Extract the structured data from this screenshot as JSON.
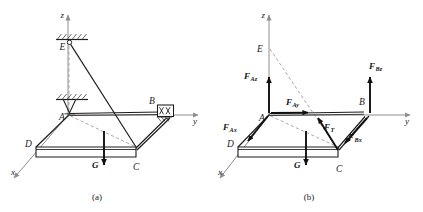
{
  "figure": {
    "panels": [
      {
        "id": "a",
        "caption": "(a)",
        "axes": [
          {
            "name": "z",
            "label": "z"
          },
          {
            "name": "y",
            "label": "y"
          },
          {
            "name": "x",
            "label": "x"
          }
        ],
        "points": [
          {
            "name": "E",
            "label": "E"
          },
          {
            "name": "A",
            "label": "A"
          },
          {
            "name": "B",
            "label": "B"
          },
          {
            "name": "C",
            "label": "C"
          },
          {
            "name": "D",
            "label": "D"
          }
        ],
        "forces": [
          {
            "name": "weight",
            "label": "G",
            "sub": "",
            "direction": "down"
          }
        ],
        "supports": [
          {
            "name": "ceiling-anchor-E",
            "type": "hatched-fixed-surface"
          },
          {
            "name": "pin-support-A",
            "type": "ball-and-socket-hatched"
          },
          {
            "name": "bearing-support-B",
            "type": "roller-box-crossed"
          }
        ]
      },
      {
        "id": "b",
        "caption": "(b)",
        "axes": [
          {
            "name": "z",
            "label": "z"
          },
          {
            "name": "y",
            "label": "y"
          },
          {
            "name": "x",
            "label": "x"
          }
        ],
        "points": [
          {
            "name": "E",
            "label": "E"
          },
          {
            "name": "A",
            "label": "A"
          },
          {
            "name": "B",
            "label": "B"
          },
          {
            "name": "C",
            "label": "C"
          },
          {
            "name": "D",
            "label": "D"
          }
        ],
        "forces": [
          {
            "name": "reaction-A-z",
            "label": "F",
            "sub": "Az",
            "direction": "up"
          },
          {
            "name": "reaction-A-y",
            "label": "F",
            "sub": "Ay",
            "direction": "right"
          },
          {
            "name": "reaction-A-x",
            "label": "F",
            "sub": "Ax",
            "direction": "down-left"
          },
          {
            "name": "cable-tension",
            "label": "F",
            "sub": "T",
            "direction": "up-left-toward-E"
          },
          {
            "name": "reaction-B-z",
            "label": "F",
            "sub": "Bz",
            "direction": "up"
          },
          {
            "name": "reaction-B-x",
            "label": "F",
            "sub": "Bx",
            "direction": "down-left"
          },
          {
            "name": "weight",
            "label": "G",
            "sub": "",
            "direction": "down"
          }
        ]
      }
    ]
  }
}
